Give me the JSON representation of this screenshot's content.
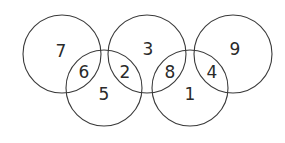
{
  "diagram": {
    "type": "overlapping-circles-number-puzzle",
    "stroke_color": "#3a3a3a",
    "text_color": "#2a2a2a",
    "background": "#ffffff",
    "circles": [
      {
        "id": "top-left",
        "cx": 62,
        "cy": 54,
        "r": 39
      },
      {
        "id": "bottom-left",
        "cx": 104,
        "cy": 88,
        "r": 38
      },
      {
        "id": "top-middle",
        "cx": 147,
        "cy": 54,
        "r": 39
      },
      {
        "id": "bottom-right",
        "cx": 190,
        "cy": 88,
        "r": 38
      },
      {
        "id": "top-right",
        "cx": 233,
        "cy": 54,
        "r": 39
      }
    ],
    "numbers": [
      {
        "region": "top-left only",
        "value": "7",
        "x": 61,
        "y": 51
      },
      {
        "region": "top-left ∩ bottom-left",
        "value": "6",
        "x": 84,
        "y": 72
      },
      {
        "region": "bottom-left only",
        "value": "5",
        "x": 104,
        "y": 94
      },
      {
        "region": "bottom-left ∩ top-middle",
        "value": "2",
        "x": 125,
        "y": 72
      },
      {
        "region": "top-middle only",
        "value": "3",
        "x": 148,
        "y": 49
      },
      {
        "region": "top-middle ∩ bottom-right",
        "value": "8",
        "x": 170,
        "y": 72
      },
      {
        "region": "bottom-right only",
        "value": "1",
        "x": 190,
        "y": 94
      },
      {
        "region": "bottom-right ∩ top-right",
        "value": "4",
        "x": 212,
        "y": 72
      },
      {
        "region": "top-right only",
        "value": "9",
        "x": 235,
        "y": 49
      }
    ]
  }
}
